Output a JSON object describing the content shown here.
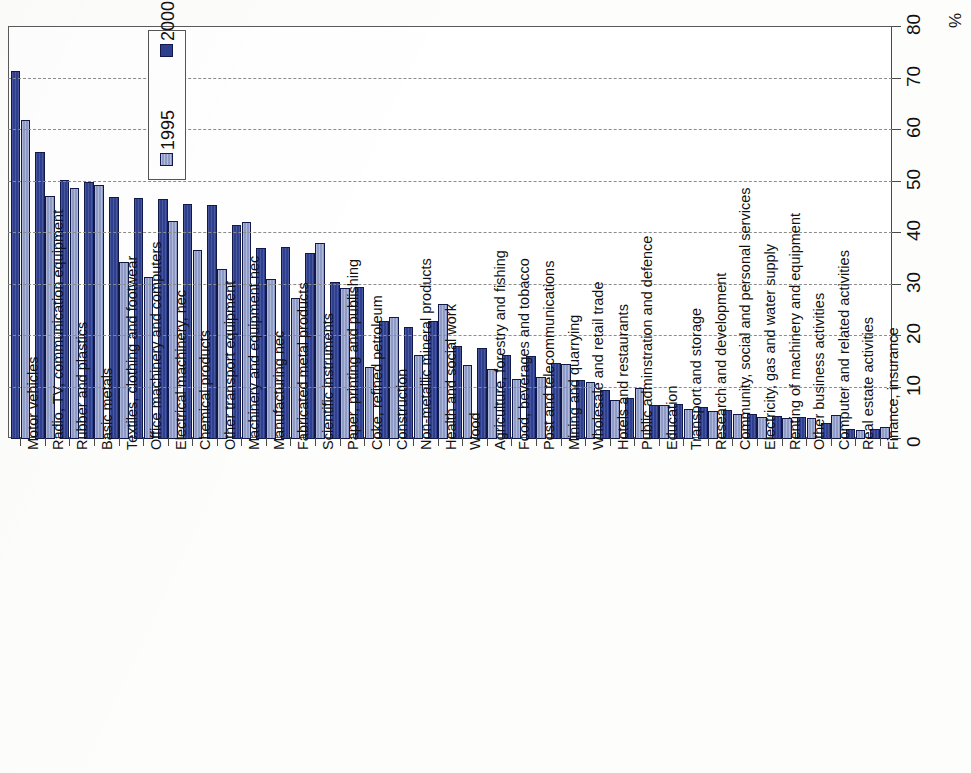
{
  "chart_data": {
    "type": "bar",
    "title": "",
    "subtitle": "",
    "xlabel": "",
    "ylabel": "",
    "unit_label": "%",
    "ylim": [
      0,
      80
    ],
    "ytick_step": 10,
    "yticks": [
      "0",
      "10",
      "20",
      "30",
      "40",
      "50",
      "60",
      "70",
      "80"
    ],
    "grid": true,
    "grid_axis": "value",
    "orientation": "vertical-bars-rotated",
    "legend": {
      "position": "top-left-inside",
      "entries": [
        {
          "name": "2000",
          "color": "#2e3f8f"
        },
        {
          "name": "1995",
          "color": "#8e9bc6"
        }
      ]
    },
    "categories": [
      "Motor vehicles",
      "Radio, TV, communication equipment",
      "Rubber and plastics",
      "Basic metals",
      "Textiles, clothing and footwear",
      "Office machinery and computers",
      "Electrical machinery, nec",
      "Chemical products",
      "Other transport equipment",
      "Machinery and equipment nec",
      "Manufacturing nec",
      "Fabricated metal products",
      "Scientific instruments",
      "Paper, printing and publishing",
      "Coke, refined petroleum",
      "Construction",
      "Non-metallic mineral products",
      "Health and social work",
      "Wood",
      "Agriculture, forestry and fishing",
      "Food, beverages and tobacco",
      "Post and telecommunications",
      "Mining and quarrying",
      "Wholesale and retail trade",
      "Hotels and restaurants",
      "Public adminstration and defence",
      "Education",
      "Transport and storage",
      "Research and development",
      "Community, social and personal services",
      "Electricity, gas and water supply",
      "Renting of machinery and equipment",
      "Other business activities",
      "Computer and related activities",
      "Real estate activities",
      "Finance, insurance"
    ],
    "series": [
      {
        "name": "1995",
        "color": "#2e3f8f",
        "values": [
          71.5,
          55.8,
          50.2,
          50.0,
          47.0,
          46.8,
          46.6,
          45.7,
          45.4,
          41.5,
          37.0,
          37.3,
          36.2,
          30.4,
          29.5,
          23.0,
          21.7,
          22.9,
          18.0,
          17.7,
          16.3,
          16.1,
          14.8,
          11.4,
          9.6,
          8.0,
          6.6,
          6.8,
          6.2,
          5.6,
          4.8,
          4.5,
          4.2,
          3.2,
          2.0,
          1.9
        ]
      },
      {
        "name": "2000",
        "color": "#8e9bc6",
        "values": [
          62.0,
          47.2,
          48.8,
          49.3,
          34.3,
          31.5,
          42.3,
          36.7,
          33.0,
          42.1,
          31.0,
          27.3,
          38.0,
          29.3,
          13.9,
          23.7,
          16.3,
          26.2,
          14.3,
          13.5,
          11.7,
          12.0,
          14.6,
          11.0,
          7.6,
          10.0,
          6.6,
          5.8,
          5.5,
          4.9,
          4.3,
          4.1,
          4.1,
          4.6,
          1.7,
          2.4
        ]
      }
    ]
  }
}
